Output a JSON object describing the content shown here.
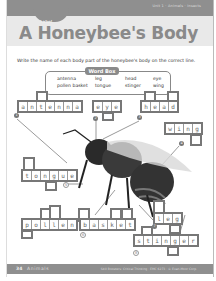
{
  "header": {
    "band_text": "Unit 1 · Animals · Insects",
    "tab_label": "Label",
    "title": "A Honeybee's Body"
  },
  "instructions": "Write the name of each body part of the honeybee's body on the correct line.",
  "word_box": {
    "title": "Word Box",
    "words": [
      "antenna",
      "leg",
      "head",
      "eye",
      "pollen basket",
      "tongue",
      "stinger",
      "wing"
    ]
  },
  "labels": [
    {
      "number": "1",
      "answer": "antenna"
    },
    {
      "number": "2",
      "answer": "eye"
    },
    {
      "number": "3",
      "answer": "head"
    },
    {
      "number": "4",
      "answer": "wing"
    },
    {
      "number": "5",
      "answer": "tongue"
    },
    {
      "number": "6",
      "answer": "pollen basket"
    },
    {
      "number": "7",
      "answer": "leg"
    },
    {
      "number": "8",
      "answer": "stinger"
    }
  ],
  "footer": {
    "page_number": "34",
    "section": "Animals",
    "credit": "Skill Boosters: Critical Thinking · EMC 6273 · © Evan-Moor Corp."
  },
  "colors": {
    "band": "#8f8f8f",
    "title_bg": "#e9e9e9",
    "title_text": "#8a8a8a",
    "box_border": "#777777"
  }
}
